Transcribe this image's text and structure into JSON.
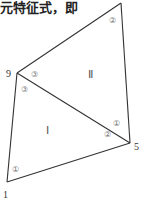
{
  "header": {
    "text": "元特征式，即"
  },
  "diagram": {
    "nodes": [
      {
        "id": "top",
        "label": "",
        "x": 121,
        "y": 3
      },
      {
        "id": "9",
        "label": "9",
        "x": 17,
        "y": 73
      },
      {
        "id": "5",
        "label": "5",
        "x": 130,
        "y": 143
      },
      {
        "id": "1",
        "label": "1",
        "x": 7,
        "y": 182
      }
    ],
    "regions": [
      {
        "id": "I",
        "label": "Ⅰ"
      },
      {
        "id": "II",
        "label": "Ⅱ"
      }
    ],
    "corner_labels": {
      "II_top": "②",
      "II_at_9": "③",
      "II_at_5": "①",
      "I_at_9": "③",
      "I_at_5": "②",
      "I_at_1": "①"
    }
  }
}
